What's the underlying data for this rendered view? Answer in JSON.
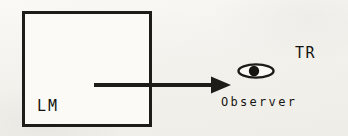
{
  "figure": {
    "type": "schematic-diagram",
    "background_color": "#f4f2ee",
    "ink_color": "#1d1c18"
  },
  "labels": {
    "lm": "LM",
    "tr": "TR",
    "observer": "Observer"
  },
  "elements": {
    "box": {
      "name": "LM region",
      "x": 22,
      "y": 11,
      "width": 130,
      "height": 116,
      "stroke_width": 3,
      "stroke_color": "#1d1c18",
      "fill_color": "#fbfaf7"
    },
    "arrow": {
      "name": "light ray arrow",
      "direction": "left-to-right",
      "start_x": 95,
      "end_x": 229,
      "y": 85,
      "shaft_thickness": 4,
      "head_length": 18,
      "head_half_width": 8,
      "color": "#1d1c18"
    },
    "eye": {
      "name": "observer eye symbol",
      "center_x": 256,
      "center_y": 71,
      "radius_x": 18,
      "radius_y": 7,
      "outline_width": 2.4,
      "pupil_radius": 5.2,
      "pupil_offset_x": -2,
      "color": "#1d1c18"
    }
  }
}
